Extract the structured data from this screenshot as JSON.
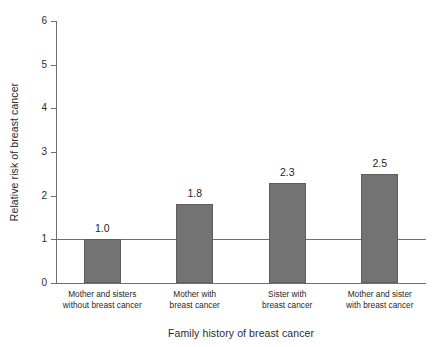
{
  "chart_data": {
    "type": "bar",
    "title": "",
    "subtitle": "",
    "xlabel": "Family history of breast cancer",
    "ylabel": "Relative risk of breast cancer",
    "categories": [
      "Mother and sisters without breast cancer",
      "Mother with breast cancer",
      "Sister with breast cancer",
      "Mother and sister with breast cancer"
    ],
    "category_lines": [
      [
        "Mother and sisters",
        "without breast cancer"
      ],
      [
        "Mother with",
        "breast cancer"
      ],
      [
        "Sister with",
        "breast cancer"
      ],
      [
        "Mother and sister",
        "with breast cancer"
      ]
    ],
    "values": [
      1.0,
      1.8,
      2.3,
      2.5
    ],
    "value_labels": [
      "1.0",
      "1.8",
      "2.3",
      "2.5"
    ],
    "ylim": [
      0,
      6
    ],
    "yticks": [
      0,
      1,
      2,
      3,
      4,
      5,
      6
    ],
    "ytick_labels": [
      "0",
      "1",
      "2",
      "3",
      "4",
      "5",
      "6"
    ],
    "grid": false,
    "legend": "none",
    "reference_line": 1.0,
    "bar_color": "#737373",
    "bar_edge_color": "#5e5e5e",
    "axis_color": "#6f6f6f",
    "text_color": "#1f1f1f",
    "background": "#ffffff"
  }
}
